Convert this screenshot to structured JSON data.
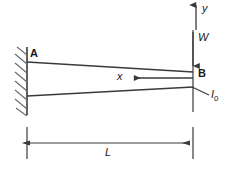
{
  "figure": {
    "type": "engineering-diagram",
    "width": 229,
    "height": 172,
    "background_color": "#ffffff",
    "line_color": "#3a3a3a",
    "text_color": "#1a1a1a"
  },
  "labels": {
    "support_point": "A",
    "free_end_point": "B",
    "vertical_axis": "y",
    "load": "W",
    "horizontal_coordinate": "x",
    "second_moment_of_area": "I",
    "second_moment_subscript": "0",
    "length_dimension": "L"
  },
  "geometry": {
    "wall": {
      "x": 27,
      "y_top": 47,
      "y_bottom": 115,
      "hatch_count": 8,
      "hatch_side": "left"
    },
    "beam": {
      "root_x": 27,
      "tip_x": 193,
      "root_top_y": 62,
      "root_bottom_y": 96,
      "tip_top_y": 72,
      "tip_bottom_y": 87,
      "taper": "depth decreases from fixed end A to free end B"
    },
    "y_axis_arrow": {
      "x": 196,
      "tail_y": 30,
      "tip_y": 2,
      "direction": "up"
    },
    "load_arrow": {
      "x": 193,
      "tail_y": 30,
      "tip_y": 70,
      "direction": "down"
    },
    "x_axis_arrow": {
      "y": 78,
      "tail_x": 193,
      "tip_x": 130,
      "direction": "left"
    },
    "inertia_leader": {
      "from_x": 193,
      "from_y": 87,
      "to_x": 209,
      "to_y": 95
    },
    "dimension_line": {
      "y": 143,
      "left_x": 27,
      "right_x": 193,
      "tick_top_y": 127,
      "tick_bottom_y": 159,
      "arrows": "both-ends"
    }
  },
  "icons": {
    "fixed-support-hatch-icon": "diagonal-hatching",
    "arrow-up-icon": "↑",
    "arrow-down-icon": "↓",
    "arrow-left-icon": "←",
    "dimension-arrow-icon": "↔"
  }
}
